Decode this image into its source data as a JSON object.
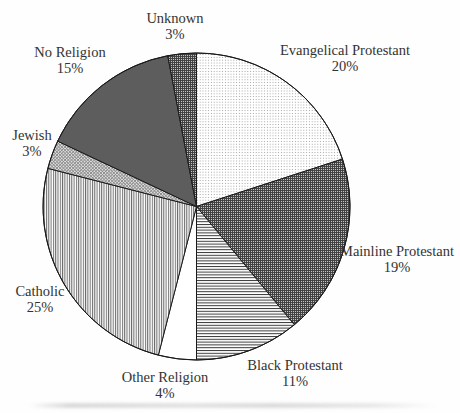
{
  "chart_data": {
    "type": "pie",
    "title": "",
    "start_angle_deg": 0,
    "direction": "clockwise",
    "legend": "none",
    "label_style": "outside, two lines (name above percent)",
    "total": 100,
    "slices": [
      {
        "label": "Evangelical Protestant",
        "value": 20,
        "pct_text": "20%",
        "pattern": "dots"
      },
      {
        "label": "Mainline Protestant",
        "value": 19,
        "pct_text": "19%",
        "pattern": "grid"
      },
      {
        "label": "Black Protestant",
        "value": 11,
        "pct_text": "11%",
        "pattern": "hlines"
      },
      {
        "label": "Other Religion",
        "value": 4,
        "pct_text": "4%",
        "pattern": "plain"
      },
      {
        "label": "Catholic",
        "value": 25,
        "pct_text": "25%",
        "pattern": "vlines"
      },
      {
        "label": "Jewish",
        "value": 3,
        "pct_text": "3%",
        "pattern": "diagonal-crosshatch"
      },
      {
        "label": "No Religion",
        "value": 15,
        "pct_text": "15%",
        "pattern": "solid-dark-gray"
      },
      {
        "label": "Unknown",
        "value": 3,
        "pct_text": "3%",
        "pattern": "grid"
      }
    ]
  },
  "colors": {
    "outline": "#1a1a1a",
    "text": "#333333",
    "no_religion_gray": "#5d5d5d",
    "background": "#fefefe"
  }
}
